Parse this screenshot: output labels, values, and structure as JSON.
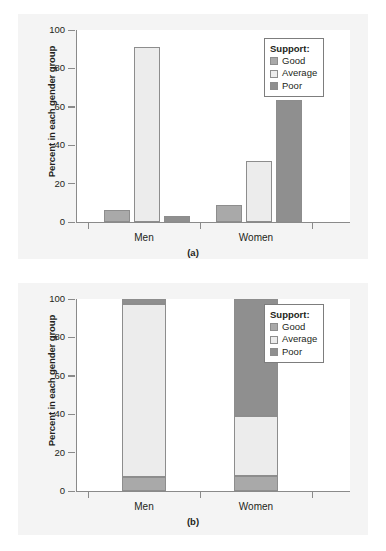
{
  "figure": {
    "background": "#ffffff",
    "panel_background": "#f4f4f4",
    "plot_background": "#ffffff"
  },
  "colors": {
    "good": "#a9a9a9",
    "average": "#ececec",
    "poor": "#8f8f8f",
    "bar_border": "#8d8d8d",
    "axis": "#8a8a8a",
    "text": "#231f20"
  },
  "legend": {
    "title": "Support:",
    "entries": [
      {
        "label": "Good",
        "color": "#a9a9a9"
      },
      {
        "label": "Average",
        "color": "#ececec"
      },
      {
        "label": "Poor",
        "color": "#8f8f8f"
      }
    ]
  },
  "axis": {
    "ylabel": "Percent in each gender group",
    "yticks": [
      "0",
      "20",
      "40",
      "60",
      "80",
      "100"
    ],
    "ytick_values": [
      0,
      20,
      40,
      60,
      80,
      100
    ],
    "ylim": [
      0,
      100
    ],
    "xcategories": [
      "Men",
      "Women"
    ]
  },
  "panels": {
    "a": {
      "caption": "(a)"
    },
    "b": {
      "caption": "(b)"
    }
  },
  "chart_data": [
    {
      "type": "bar",
      "id": "a",
      "title": "(a)",
      "subtitle": "",
      "xlabel": "",
      "ylabel": "Percent in each gender group",
      "categories": [
        "Men",
        "Women"
      ],
      "series": [
        {
          "name": "Good",
          "values": [
            6,
            9
          ],
          "color": "#a9a9a9"
        },
        {
          "name": "Average",
          "values": [
            91,
            32
          ],
          "color": "#ececec"
        },
        {
          "name": "Poor",
          "values": [
            3,
            63.5
          ],
          "color": "#8f8f8f"
        }
      ],
      "ylim": [
        0,
        100
      ],
      "yticks": [
        0,
        20,
        40,
        60,
        80,
        100
      ],
      "grid": false,
      "legend_position": "top-right",
      "legend_title": "Support:",
      "grouping": "grouped"
    },
    {
      "type": "bar",
      "id": "b",
      "title": "(b)",
      "subtitle": "",
      "xlabel": "",
      "ylabel": "Percent in each gender group",
      "categories": [
        "Men",
        "Women"
      ],
      "series": [
        {
          "name": "Good",
          "values": [
            7.5,
            8
          ],
          "color": "#a9a9a9"
        },
        {
          "name": "Average",
          "values": [
            90,
            31
          ],
          "color": "#ececec"
        },
        {
          "name": "Poor",
          "values": [
            2.5,
            61
          ],
          "color": "#8f8f8f"
        }
      ],
      "ylim": [
        0,
        100
      ],
      "yticks": [
        0,
        20,
        40,
        60,
        80,
        100
      ],
      "grid": false,
      "legend_position": "top-right",
      "legend_title": "Support:",
      "grouping": "stacked"
    }
  ]
}
